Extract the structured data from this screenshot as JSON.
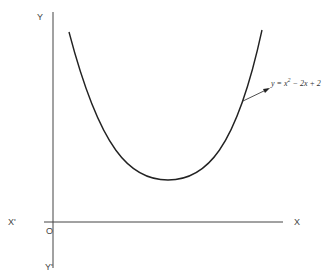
{
  "diagram": {
    "title": "",
    "axes": {
      "x_positive_label": "X",
      "x_negative_label": "X'",
      "y_positive_label": "Y",
      "y_negative_label": "Y'",
      "origin_label": "O"
    },
    "curve": {
      "equation_prefix": "y = x",
      "equation_exp": "2",
      "equation_suffix": " − 2x + 2",
      "type": "parabola",
      "vertex": [
        1,
        1
      ]
    },
    "colors": {
      "curve": "#222222",
      "axes": "#444444"
    }
  }
}
